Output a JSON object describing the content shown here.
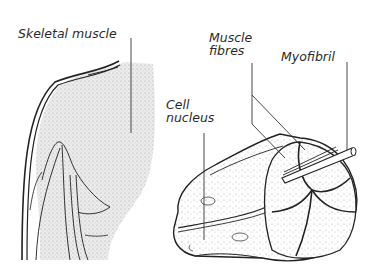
{
  "diagram": {
    "labels": {
      "skeletal_muscle": "Skeletal muscle",
      "muscle_fibres_line1": "Muscle",
      "muscle_fibres_line2": "fibres",
      "myofibril": "Myofibril",
      "cell_nucleus_line1": "Cell",
      "cell_nucleus_line2": "nucleus"
    },
    "colors": {
      "stroke": "#222222",
      "stipple_fill": "#e6e6e6",
      "background": "#ffffff"
    }
  }
}
